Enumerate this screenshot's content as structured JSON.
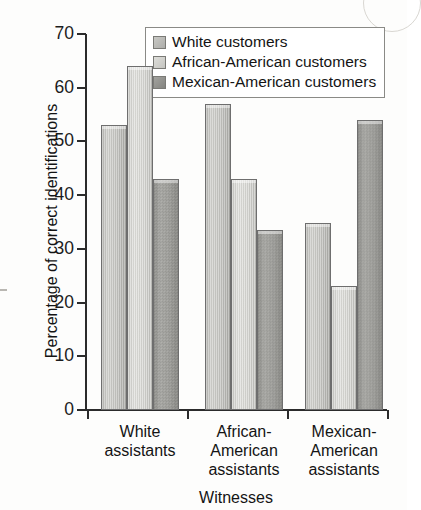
{
  "chart_data": {
    "type": "bar",
    "title": "",
    "xlabel": "Witnesses",
    "ylabel": "Percentage of correct identifications",
    "ylim": [
      0,
      70
    ],
    "ytick_labels": [
      "70",
      "60",
      "50",
      "40",
      "30",
      "20",
      "10",
      "0"
    ],
    "yticks": [
      70,
      60,
      50,
      40,
      30,
      20,
      10,
      0
    ],
    "grid": false,
    "legend_position": "top-center",
    "categories": [
      "White assistants",
      "African-American assistants",
      "Mexican-American assistants"
    ],
    "category_lines": [
      [
        "White",
        "assistants"
      ],
      [
        "African-",
        "American",
        "assistants"
      ],
      [
        "Mexican-",
        "American",
        "assistants"
      ]
    ],
    "series": [
      {
        "name": "White customers",
        "color": "#c2c2be",
        "values": [
          53,
          57,
          34.8
        ]
      },
      {
        "name": "African-American customers",
        "color": "#d4d4d0",
        "values": [
          64,
          43,
          23
        ]
      },
      {
        "name": "Mexican-American customers",
        "color": "#9b9b97",
        "values": [
          43,
          33.6,
          54
        ]
      }
    ]
  },
  "legend": {
    "items": [
      {
        "label": "White customers"
      },
      {
        "label": "African-American customers"
      },
      {
        "label": "Mexican-American customers"
      }
    ]
  }
}
